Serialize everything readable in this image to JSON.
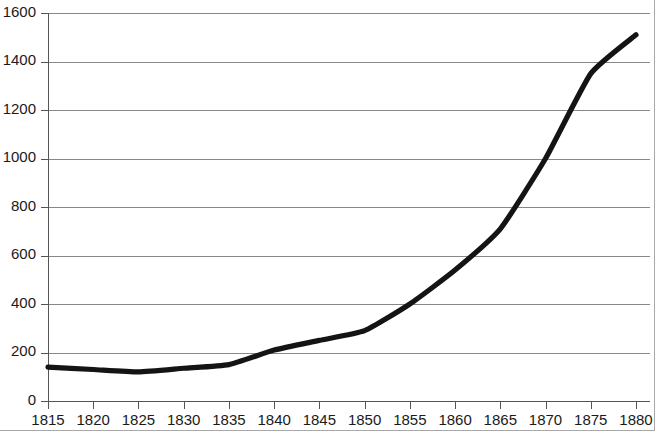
{
  "chart_data": {
    "type": "line",
    "title": "",
    "subtitle": "",
    "xlabel": "",
    "ylabel": "",
    "xlim": [
      1815,
      1880
    ],
    "ylim": [
      0,
      1600
    ],
    "grid": true,
    "legend": null,
    "legend_position": "none",
    "x_ticks": [
      1815,
      1820,
      1825,
      1830,
      1835,
      1840,
      1845,
      1850,
      1855,
      1860,
      1865,
      1870,
      1875,
      1880
    ],
    "x_tick_labels": [
      "1815",
      "1820",
      "1825",
      "1830",
      "1835",
      "1840",
      "1845",
      "1850",
      "1855",
      "1860",
      "1865",
      "1870",
      "1875",
      "1880"
    ],
    "y_ticks": [
      0,
      200,
      400,
      600,
      800,
      1000,
      1200,
      1400,
      1600
    ],
    "y_tick_labels": [
      "0",
      "200",
      "400",
      "600",
      "800",
      "1000",
      "1200",
      "1400",
      "1600"
    ],
    "y_top_label_clipped": true,
    "series": [
      {
        "name": "series-1",
        "color": "#141414",
        "line_width": 5,
        "x": [
          1815,
          1820,
          1825,
          1830,
          1835,
          1840,
          1845,
          1850,
          1855,
          1860,
          1865,
          1870,
          1875,
          1880
        ],
        "values": [
          140,
          130,
          120,
          135,
          150,
          210,
          250,
          290,
          400,
          540,
          710,
          1000,
          1350,
          1510
        ]
      }
    ]
  },
  "axes": {
    "y_axis_name": "value-axis",
    "x_axis_name": "year-axis"
  }
}
